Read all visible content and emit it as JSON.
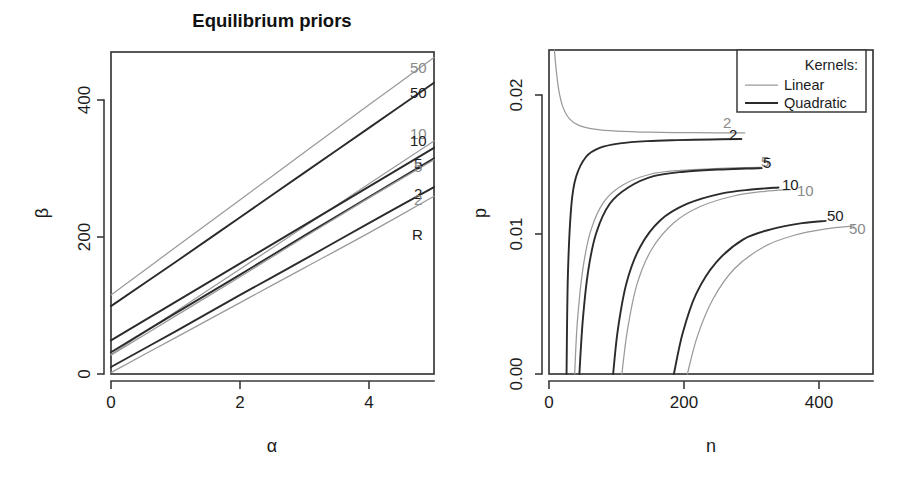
{
  "figure": {
    "width": 905,
    "height": 482,
    "background": "#ffffff",
    "colors": {
      "linear_kernel": "#9a9a9a",
      "quadratic_kernel": "#2b2b2b",
      "axis": "#3a3a3a",
      "text": "#1c1c1c"
    }
  },
  "chart_data": [
    {
      "id": "left-panel",
      "type": "line",
      "title": "Equilibrium priors",
      "xlabel": "α",
      "ylabel": "β",
      "xlim": [
        0,
        5
      ],
      "ylim": [
        0,
        460
      ],
      "xticks": [
        0,
        2,
        4
      ],
      "xtick_labels": [
        "0",
        "2",
        "4"
      ],
      "yticks": [
        0,
        200,
        400
      ],
      "ytick_labels": [
        "0",
        "200",
        "400"
      ],
      "grid": false,
      "legend": null,
      "end_labels": [
        "50",
        "50",
        "10",
        "10",
        "5",
        "5",
        "2",
        "2",
        "R"
      ],
      "series": [
        {
          "name": "50",
          "kernel": "Linear",
          "label": "50",
          "label_color": "#9a9a9a",
          "x": [
            0,
            1,
            2,
            3,
            4,
            5
          ],
          "values": [
            113,
            181,
            249,
            317,
            385,
            452
          ]
        },
        {
          "name": "50",
          "kernel": "Quadratic",
          "label": "50",
          "label_color": "#2b2b2b",
          "x": [
            0,
            1,
            2,
            3,
            4,
            5
          ],
          "values": [
            97,
            160,
            224,
            288,
            352,
            416
          ]
        },
        {
          "name": "10",
          "kernel": "Linear",
          "label": "10",
          "label_color": "#9a9a9a",
          "x": [
            0,
            1,
            2,
            3,
            4,
            5
          ],
          "values": [
            28,
            89,
            150,
            211,
            272,
            333
          ]
        },
        {
          "name": "10",
          "kernel": "Quadratic",
          "label": "10",
          "label_color": "#2b2b2b",
          "x": [
            0,
            1,
            2,
            3,
            4,
            5
          ],
          "values": [
            48,
            103,
            158,
            213,
            268,
            323
          ]
        },
        {
          "name": "5",
          "kernel": "Quadratic",
          "label": "5",
          "label_color": "#2b2b2b",
          "x": [
            0,
            1,
            2,
            3,
            4,
            5
          ],
          "values": [
            31,
            87,
            142,
            198,
            253,
            308
          ]
        },
        {
          "name": "5",
          "kernel": "Linear",
          "label": "5",
          "label_color": "#9a9a9a",
          "x": [
            0,
            1,
            2,
            3,
            4,
            5
          ],
          "values": [
            27,
            83,
            139,
            196,
            252,
            306
          ]
        },
        {
          "name": "2",
          "kernel": "Quadratic",
          "label": "2",
          "label_color": "#2b2b2b",
          "x": [
            0,
            1,
            2,
            3,
            4,
            5
          ],
          "values": [
            10,
            61,
            113,
            164,
            216,
            267
          ]
        },
        {
          "name": "2",
          "kernel": "Linear",
          "label": "2",
          "label_color": "#9a9a9a",
          "x": [
            0,
            1,
            2,
            3,
            4,
            5
          ],
          "values": [
            2,
            52,
            102,
            152,
            202,
            254
          ]
        }
      ]
    },
    {
      "id": "right-panel",
      "type": "line",
      "title": "",
      "xlabel": "n",
      "ylabel": "p",
      "xlim": [
        0,
        480
      ],
      "ylim": [
        0.0,
        0.0255
      ],
      "xticks": [
        0,
        200,
        400
      ],
      "xtick_labels": [
        "0",
        "200",
        "400"
      ],
      "yticks": [
        0.0,
        0.01,
        0.02
      ],
      "ytick_labels": [
        "0.00",
        "0.01",
        "0.02"
      ],
      "grid": false,
      "legend": {
        "title": "Kernels:",
        "position": "top-right",
        "entries": [
          {
            "label": "Linear",
            "color": "#9a9a9a",
            "width": 1.25
          },
          {
            "label": "Quadratic",
            "color": "#2b2b2b",
            "width": 1.9
          }
        ]
      },
      "end_labels": [
        "2",
        "2",
        "5",
        "5",
        "10",
        "10",
        "50",
        "50"
      ],
      "series": [
        {
          "name": "2",
          "kernel": "Linear",
          "label": "2",
          "label_color": "#9a9a9a",
          "x": [
            8,
            10,
            14,
            20,
            30,
            45,
            70,
            100,
            150,
            200,
            250,
            290
          ],
          "values": [
            0.0255,
            0.0243,
            0.0225,
            0.0211,
            0.0201,
            0.01955,
            0.01925,
            0.01912,
            0.01903,
            0.019,
            0.01898,
            0.01897
          ]
        },
        {
          "name": "2",
          "kernel": "Quadratic",
          "label": "2",
          "label_color": "#2b2b2b",
          "x": [
            26,
            28,
            33,
            40,
            55,
            75,
            105,
            145,
            190,
            240,
            285
          ],
          "values": [
            0.0,
            0.0078,
            0.0132,
            0.0155,
            0.0171,
            0.0178,
            0.01815,
            0.01833,
            0.01841,
            0.01846,
            0.01849
          ]
        },
        {
          "name": "5",
          "kernel": "Linear",
          "label": "5",
          "label_color": "#9a9a9a",
          "x": [
            38,
            42,
            50,
            62,
            82,
            110,
            150,
            195,
            245,
            290,
            315
          ],
          "values": [
            0.0,
            0.0041,
            0.0082,
            0.0113,
            0.0136,
            0.0149,
            0.01572,
            0.01603,
            0.01617,
            0.01624,
            0.01626
          ]
        },
        {
          "name": "5",
          "kernel": "Quadratic",
          "label": "5",
          "label_color": "#2b2b2b",
          "x": [
            45,
            50,
            58,
            70,
            90,
            118,
            155,
            200,
            250,
            292,
            315
          ],
          "values": [
            0.0,
            0.0042,
            0.0081,
            0.0111,
            0.0134,
            0.0147,
            0.01557,
            0.01592,
            0.01609,
            0.01617,
            0.0162
          ]
        },
        {
          "name": "10",
          "kernel": "Quadratic",
          "label": "10",
          "label_color": "#2b2b2b",
          "x": [
            95,
            102,
            115,
            135,
            165,
            205,
            255,
            300,
            340
          ],
          "values": [
            0.0,
            0.0035,
            0.0072,
            0.01,
            0.0121,
            0.0134,
            0.0142,
            0.01452,
            0.01468
          ]
        },
        {
          "name": "10",
          "kernel": "Linear",
          "label": "10",
          "label_color": "#9a9a9a",
          "x": [
            108,
            116,
            130,
            152,
            185,
            225,
            275,
            320,
            358
          ],
          "values": [
            0.0,
            0.0034,
            0.007,
            0.0098,
            0.0119,
            0.0132,
            0.01403,
            0.01438,
            0.01452
          ]
        },
        {
          "name": "50",
          "kernel": "Quadratic",
          "label": "50",
          "label_color": "#2b2b2b",
          "x": [
            185,
            198,
            218,
            248,
            288,
            330,
            375,
            410
          ],
          "values": [
            0.0,
            0.0032,
            0.0063,
            0.0088,
            0.0106,
            0.0114,
            0.01187,
            0.01205
          ]
        },
        {
          "name": "50",
          "kernel": "Linear",
          "label": "50",
          "label_color": "#9a9a9a",
          "x": [
            205,
            220,
            243,
            275,
            318,
            362,
            410,
            452
          ],
          "values": [
            0.0,
            0.003,
            0.0059,
            0.0083,
            0.01,
            0.0109,
            0.01142,
            0.01166
          ]
        }
      ]
    }
  ],
  "left_panel": {
    "title": "Equilibrium priors",
    "xlabel": "α",
    "ylabel": "β",
    "xtick_labels": [
      "0",
      "2",
      "4"
    ],
    "ytick_labels": [
      "0",
      "200",
      "400"
    ],
    "curve_labels": [
      {
        "text": "50",
        "color": "light"
      },
      {
        "text": "50",
        "color": "dark"
      },
      {
        "text": "10",
        "color": "light"
      },
      {
        "text": "10",
        "color": "dark"
      },
      {
        "text": "5",
        "color": "dark"
      },
      {
        "text": "5",
        "color": "light"
      },
      {
        "text": "2",
        "color": "dark"
      },
      {
        "text": "2",
        "color": "light"
      },
      {
        "text": "R",
        "color": "dark"
      }
    ]
  },
  "right_panel": {
    "title": "",
    "xlabel": "n",
    "ylabel": "p",
    "xtick_labels": [
      "0",
      "200",
      "400"
    ],
    "ytick_labels": [
      "0.00",
      "0.01",
      "0.02"
    ],
    "legend": {
      "title": "Kernels:",
      "linear": "Linear",
      "quadratic": "Quadratic"
    },
    "curve_labels": [
      {
        "text": "2",
        "color": "light"
      },
      {
        "text": "2",
        "color": "dark"
      },
      {
        "text": "5",
        "color": "light"
      },
      {
        "text": "5",
        "color": "dark"
      },
      {
        "text": "10",
        "color": "dark"
      },
      {
        "text": "10",
        "color": "light"
      },
      {
        "text": "50",
        "color": "dark"
      },
      {
        "text": "50",
        "color": "light"
      }
    ]
  }
}
